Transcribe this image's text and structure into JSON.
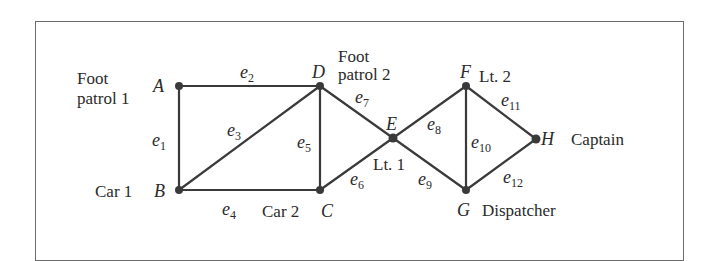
{
  "diagram": {
    "type": "graph",
    "colors": {
      "line": "#3a3a3a",
      "text": "#2a2a2a",
      "border": "#6b6b6b",
      "background": "#ffffff"
    },
    "vertices": [
      {
        "id": "A",
        "label": "A",
        "role": [
          "Foot",
          "patrol 1"
        ],
        "x": 179,
        "y": 86
      },
      {
        "id": "B",
        "label": "B",
        "role": [
          "Car 1"
        ],
        "x": 179,
        "y": 190
      },
      {
        "id": "C",
        "label": "C",
        "role": [
          "Car 2"
        ],
        "x": 320,
        "y": 190
      },
      {
        "id": "D",
        "label": "D",
        "role": [
          "Foot",
          "patrol 2"
        ],
        "x": 320,
        "y": 86
      },
      {
        "id": "E",
        "label": "E",
        "role": [
          "Lt. 1"
        ],
        "x": 393,
        "y": 138
      },
      {
        "id": "F",
        "label": "F",
        "role": [
          "Lt. 2"
        ],
        "x": 466,
        "y": 86
      },
      {
        "id": "G",
        "label": "G",
        "role": [
          "Dispatcher"
        ],
        "x": 466,
        "y": 190
      },
      {
        "id": "H",
        "label": "H",
        "role": [
          "Captain"
        ],
        "x": 536,
        "y": 139
      }
    ],
    "edges": [
      {
        "id": "e1",
        "base": "e",
        "sub": "1",
        "from": "A",
        "to": "B"
      },
      {
        "id": "e2",
        "base": "e",
        "sub": "2",
        "from": "A",
        "to": "D"
      },
      {
        "id": "e3",
        "base": "e",
        "sub": "3",
        "from": "B",
        "to": "D"
      },
      {
        "id": "e4",
        "base": "e",
        "sub": "4",
        "from": "B",
        "to": "C"
      },
      {
        "id": "e5",
        "base": "e",
        "sub": "5",
        "from": "C",
        "to": "D"
      },
      {
        "id": "e6",
        "base": "e",
        "sub": "6",
        "from": "C",
        "to": "E"
      },
      {
        "id": "e7",
        "base": "e",
        "sub": "7",
        "from": "D",
        "to": "E"
      },
      {
        "id": "e8",
        "base": "e",
        "sub": "8",
        "from": "E",
        "to": "F"
      },
      {
        "id": "e9",
        "base": "e",
        "sub": "9",
        "from": "E",
        "to": "G"
      },
      {
        "id": "e10",
        "base": "e",
        "sub": "10",
        "from": "F",
        "to": "G"
      },
      {
        "id": "e11",
        "base": "e",
        "sub": "11",
        "from": "F",
        "to": "H"
      },
      {
        "id": "e12",
        "base": "e",
        "sub": "12",
        "from": "G",
        "to": "H"
      }
    ]
  }
}
